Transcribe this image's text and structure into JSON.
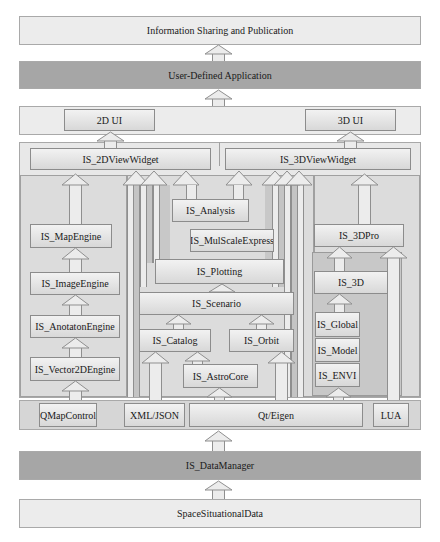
{
  "layers": {
    "top": "Information Sharing and Publication",
    "app": "User-Defined Application",
    "data_manager": "IS_DataManager",
    "source": "SpaceSituationalData"
  },
  "ui_layer": {
    "left": "2D UI",
    "right": "3D UI"
  },
  "widgets": {
    "view2d": "IS_2DViewWidget",
    "view3d": "IS_3DViewWidget"
  },
  "left_stack": [
    "IS_MapEngine",
    "IS_ImageEngine",
    "IS_AnotatonEngine",
    "IS_Vector2DEngine"
  ],
  "center": {
    "analysis": "IS_Analysis",
    "mulscale": "IS_MulScaleExpress",
    "plotting": "IS_Plotting",
    "scenario": "IS_Scenario",
    "catalog": "IS_Catalog",
    "orbit": "IS_Orbit",
    "astrocore": "IS_AstroCore"
  },
  "right_stack": {
    "pro3d": "IS_3DPro",
    "is3d": "IS_3D",
    "global": "IS_Global",
    "model": "IS_Model",
    "envi": "IS_ENVI"
  },
  "libs": {
    "qmap": "QMapControl",
    "xml": "XML/JSON",
    "qt": "Qt/Eigen",
    "lua": "LUA"
  }
}
